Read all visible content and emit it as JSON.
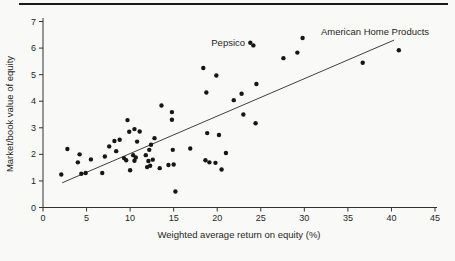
{
  "figure": {
    "background": "#f9f9f7",
    "top_rule_color": "#1b1b1b",
    "point_color": "#161616",
    "axis_color": "#333333",
    "line_color": "#2a2a2a"
  },
  "chart_data": {
    "type": "scatter",
    "title": "",
    "xlabel": "Weighted average return on equity (%)",
    "ylabel": "Market/book value of equity",
    "xlim": [
      0,
      45
    ],
    "ylim": [
      0,
      7
    ],
    "x_ticks": [
      0,
      5,
      10,
      15,
      20,
      25,
      30,
      35,
      40,
      45
    ],
    "y_ticks": [
      0,
      1,
      2,
      3,
      4,
      5,
      6,
      7
    ],
    "grid": false,
    "legend": "none",
    "points": [
      [
        2.1,
        1.24
      ],
      [
        2.8,
        2.2
      ],
      [
        4.0,
        1.7
      ],
      [
        4.2,
        2.0
      ],
      [
        4.4,
        1.27
      ],
      [
        4.9,
        1.3
      ],
      [
        5.5,
        1.81
      ],
      [
        6.8,
        1.3
      ],
      [
        7.1,
        1.92
      ],
      [
        7.6,
        2.3
      ],
      [
        8.2,
        2.5
      ],
      [
        8.8,
        2.55
      ],
      [
        8.4,
        2.12
      ],
      [
        9.3,
        1.86
      ],
      [
        9.55,
        1.78
      ],
      [
        9.7,
        3.29
      ],
      [
        9.9,
        2.85
      ],
      [
        10.5,
        2.95
      ],
      [
        11.1,
        2.86
      ],
      [
        10.8,
        2.48
      ],
      [
        10.35,
        1.97
      ],
      [
        10.65,
        1.88
      ],
      [
        10.5,
        1.76
      ],
      [
        10.0,
        1.4
      ],
      [
        11.8,
        1.97
      ],
      [
        12.1,
        1.75
      ],
      [
        11.95,
        1.52
      ],
      [
        12.2,
        2.17
      ],
      [
        12.4,
        2.36
      ],
      [
        12.8,
        2.61
      ],
      [
        12.6,
        1.8
      ],
      [
        12.3,
        1.57
      ],
      [
        13.4,
        1.48
      ],
      [
        14.4,
        1.6
      ],
      [
        15.0,
        1.62
      ],
      [
        15.2,
        0.6
      ],
      [
        13.6,
        3.84
      ],
      [
        14.8,
        3.59
      ],
      [
        14.8,
        3.3
      ],
      [
        14.9,
        2.17
      ],
      [
        16.9,
        2.22
      ],
      [
        18.4,
        5.25
      ],
      [
        19.9,
        4.97
      ],
      [
        18.75,
        4.33
      ],
      [
        21.9,
        4.04
      ],
      [
        22.8,
        4.28
      ],
      [
        24.5,
        4.65
      ],
      [
        23.0,
        3.5
      ],
      [
        24.4,
        3.17
      ],
      [
        18.85,
        2.8
      ],
      [
        20.2,
        2.73
      ],
      [
        21.0,
        2.05
      ],
      [
        18.65,
        1.78
      ],
      [
        19.1,
        1.7
      ],
      [
        19.8,
        1.68
      ],
      [
        20.5,
        1.43
      ],
      [
        23.8,
        6.2
      ],
      [
        24.15,
        6.1
      ],
      [
        27.6,
        5.62
      ],
      [
        29.2,
        5.83
      ],
      [
        29.8,
        6.38
      ],
      [
        36.7,
        5.45
      ],
      [
        40.85,
        5.92
      ]
    ],
    "trend_line": {
      "x1": 2.2,
      "y1": 0.93,
      "x2": 40.3,
      "y2": 6.3
    },
    "annotations": [
      {
        "text": "Pepsico",
        "x": 23.2,
        "y": 6.18,
        "align": "end"
      },
      {
        "text": "American Home Products",
        "x": 31.9,
        "y": 6.62,
        "align": "start"
      }
    ]
  }
}
